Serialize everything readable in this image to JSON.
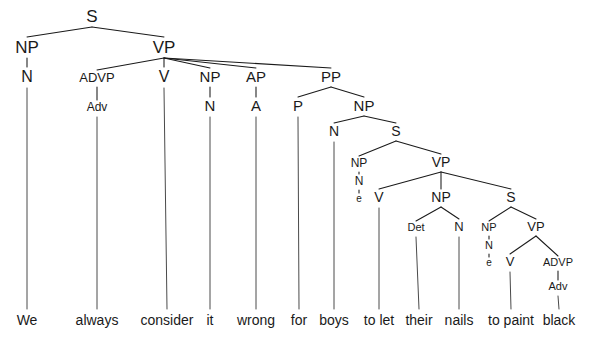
{
  "figure": {
    "type": "syntax-tree",
    "sentence": "We always consider it wrong for boys to let their nails to paint black",
    "width": 592,
    "height": 343,
    "background_color": "#ffffff",
    "line_color": "#1a1a1a",
    "text_color": "#1a1a1a"
  },
  "nodes": [
    {
      "id": "n0",
      "label": "S",
      "x": 92,
      "y": 22,
      "font_size": 17
    },
    {
      "id": "n1",
      "label": "NP",
      "x": 27,
      "y": 53,
      "font_size": 17
    },
    {
      "id": "n2",
      "label": "VP",
      "x": 164,
      "y": 53,
      "font_size": 17
    },
    {
      "id": "n3",
      "label": "N",
      "x": 27,
      "y": 82,
      "font_size": 16
    },
    {
      "id": "n4",
      "label": "ADVP",
      "x": 97,
      "y": 82,
      "font_size": 13
    },
    {
      "id": "n5",
      "label": "V",
      "x": 164,
      "y": 82,
      "font_size": 16
    },
    {
      "id": "n6",
      "label": "NP",
      "x": 210,
      "y": 82,
      "font_size": 15
    },
    {
      "id": "n7",
      "label": "AP",
      "x": 256,
      "y": 82,
      "font_size": 15
    },
    {
      "id": "n8",
      "label": "PP",
      "x": 331,
      "y": 82,
      "font_size": 15
    },
    {
      "id": "n9",
      "label": "Adv",
      "x": 97,
      "y": 111,
      "font_size": 12
    },
    {
      "id": "n10",
      "label": "N",
      "x": 210,
      "y": 111,
      "font_size": 15
    },
    {
      "id": "n11",
      "label": "A",
      "x": 256,
      "y": 111,
      "font_size": 15
    },
    {
      "id": "n12",
      "label": "P",
      "x": 298,
      "y": 111,
      "font_size": 15
    },
    {
      "id": "n13",
      "label": "NP",
      "x": 364,
      "y": 111,
      "font_size": 15
    },
    {
      "id": "n14",
      "label": "N",
      "x": 334,
      "y": 136,
      "font_size": 14
    },
    {
      "id": "n15",
      "label": "S",
      "x": 396,
      "y": 136,
      "font_size": 14
    },
    {
      "id": "n16",
      "label": "NP",
      "x": 359,
      "y": 167,
      "font_size": 12
    },
    {
      "id": "n17",
      "label": "VP",
      "x": 441,
      "y": 167,
      "font_size": 14
    },
    {
      "id": "n18",
      "label": "N",
      "x": 359,
      "y": 185,
      "font_size": 12
    },
    {
      "id": "n19",
      "label": "e",
      "x": 359,
      "y": 202,
      "font_size": 10
    },
    {
      "id": "n20",
      "label": "V",
      "x": 379,
      "y": 202,
      "font_size": 14
    },
    {
      "id": "n21",
      "label": "NP",
      "x": 441,
      "y": 202,
      "font_size": 14
    },
    {
      "id": "n22",
      "label": "S",
      "x": 511,
      "y": 202,
      "font_size": 14
    },
    {
      "id": "n23",
      "label": "Det",
      "x": 416,
      "y": 231,
      "font_size": 11
    },
    {
      "id": "n24",
      "label": "N",
      "x": 459,
      "y": 231,
      "font_size": 13
    },
    {
      "id": "n25",
      "label": "NP",
      "x": 489,
      "y": 231,
      "font_size": 11
    },
    {
      "id": "n26",
      "label": "VP",
      "x": 536,
      "y": 231,
      "font_size": 13
    },
    {
      "id": "n27",
      "label": "N",
      "x": 489,
      "y": 249,
      "font_size": 11
    },
    {
      "id": "n28",
      "label": "e",
      "x": 489,
      "y": 266,
      "font_size": 10
    },
    {
      "id": "n29",
      "label": "V",
      "x": 510,
      "y": 266,
      "font_size": 13
    },
    {
      "id": "n30",
      "label": "ADVP",
      "x": 558,
      "y": 266,
      "font_size": 11
    },
    {
      "id": "n31",
      "label": "Adv",
      "x": 558,
      "y": 290,
      "font_size": 11
    }
  ],
  "edges": [
    {
      "from": "n0",
      "to": "n1"
    },
    {
      "from": "n0",
      "to": "n2"
    },
    {
      "from": "n1",
      "to": "n3"
    },
    {
      "from": "n2",
      "to": "n4"
    },
    {
      "from": "n2",
      "to": "n5"
    },
    {
      "from": "n2",
      "to": "n6"
    },
    {
      "from": "n2",
      "to": "n7"
    },
    {
      "from": "n2",
      "to": "n8"
    },
    {
      "from": "n4",
      "to": "n9"
    },
    {
      "from": "n6",
      "to": "n10"
    },
    {
      "from": "n7",
      "to": "n11"
    },
    {
      "from": "n8",
      "to": "n12"
    },
    {
      "from": "n8",
      "to": "n13"
    },
    {
      "from": "n13",
      "to": "n14"
    },
    {
      "from": "n13",
      "to": "n15"
    },
    {
      "from": "n15",
      "to": "n16"
    },
    {
      "from": "n15",
      "to": "n17"
    },
    {
      "from": "n16",
      "to": "n18"
    },
    {
      "from": "n18",
      "to": "n19"
    },
    {
      "from": "n17",
      "to": "n20"
    },
    {
      "from": "n17",
      "to": "n21"
    },
    {
      "from": "n17",
      "to": "n22"
    },
    {
      "from": "n21",
      "to": "n23"
    },
    {
      "from": "n21",
      "to": "n24"
    },
    {
      "from": "n22",
      "to": "n25"
    },
    {
      "from": "n22",
      "to": "n26"
    },
    {
      "from": "n25",
      "to": "n27"
    },
    {
      "from": "n27",
      "to": "n28"
    },
    {
      "from": "n26",
      "to": "n29"
    },
    {
      "from": "n26",
      "to": "n30"
    },
    {
      "from": "n30",
      "to": "n31"
    }
  ],
  "leaves": [
    {
      "id": "w0",
      "word": "We",
      "x": 27,
      "y": 325,
      "parent": "n3",
      "stem_top": 88
    },
    {
      "id": "w1",
      "word": "always",
      "x": 97,
      "y": 325,
      "parent": "n9",
      "stem_top": 117
    },
    {
      "id": "w2",
      "word": "consider",
      "x": 167,
      "y": 325,
      "parent": "n5",
      "stem_top": 88
    },
    {
      "id": "w3",
      "word": "it",
      "x": 210,
      "y": 325,
      "parent": "n10",
      "stem_top": 117
    },
    {
      "id": "w4",
      "word": "wrong",
      "x": 256,
      "y": 325,
      "parent": "n11",
      "stem_top": 117
    },
    {
      "id": "w5",
      "word": "for",
      "x": 299,
      "y": 325,
      "parent": "n12",
      "stem_top": 117
    },
    {
      "id": "w6",
      "word": "boys",
      "x": 334,
      "y": 325,
      "parent": "n14",
      "stem_top": 142
    },
    {
      "id": "w7",
      "word": "to let",
      "x": 379,
      "y": 325,
      "parent": "n20",
      "stem_top": 208
    },
    {
      "id": "w8",
      "word": "their",
      "x": 419,
      "y": 325,
      "parent": "n23",
      "stem_top": 237
    },
    {
      "id": "w9",
      "word": "nails",
      "x": 459,
      "y": 325,
      "parent": "n24",
      "stem_top": 237
    },
    {
      "id": "w10",
      "word": "to paint",
      "x": 511,
      "y": 325,
      "parent": "n29",
      "stem_top": 272
    },
    {
      "id": "w11",
      "word": "black",
      "x": 559,
      "y": 325,
      "parent": "n31",
      "stem_top": 296
    }
  ],
  "leaf_font_size": 14
}
